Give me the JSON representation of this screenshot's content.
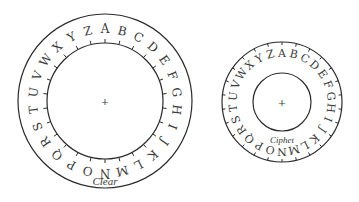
{
  "diagram": {
    "alphabet": [
      "A",
      "B",
      "C",
      "D",
      "E",
      "F",
      "G",
      "H",
      "I",
      "J",
      "K",
      "L",
      "M",
      "N",
      "O",
      "P",
      "Q",
      "R",
      "S",
      "T",
      "U",
      "V",
      "W",
      "X",
      "Y",
      "Z"
    ],
    "colors": {
      "stroke": "#2b2b2b",
      "text": "#3a3a3a",
      "background": "#ffffff"
    },
    "wheels": [
      {
        "id": "clear",
        "label": "Clear",
        "center": [
          105,
          101
        ],
        "outer_radius": 87,
        "inner_radius": 58,
        "letter_radius": 72,
        "letter_size": 12,
        "ticks_on": "inner",
        "tick_length": 4,
        "start_letter": "A",
        "center_mark": "+",
        "label_position": [
          105,
          181
        ],
        "label_size": 11
      },
      {
        "id": "cipher",
        "label": "Ciphet",
        "center": [
          282,
          102
        ],
        "outer_radius": 60,
        "inner_radius": 29,
        "letter_radius": 49,
        "letter_size": 11,
        "ticks_on": "outer",
        "tick_length": 3,
        "start_letter": "A",
        "center_mark": "+",
        "label_position": [
          282,
          140
        ],
        "label_size": 9
      }
    ]
  }
}
